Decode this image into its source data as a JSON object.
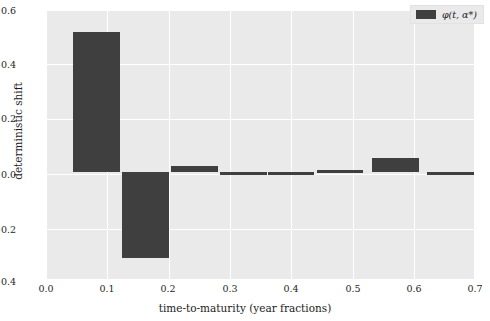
{
  "chart_data": {
    "type": "bar",
    "title": "",
    "xlabel": "time-to-maturity (year fractions)",
    "ylabel": "deterministic shift",
    "xlim": [
      0.0,
      0.7
    ],
    "ylim": [
      -0.4,
      0.6
    ],
    "xticks": [
      "0.0",
      "0.1",
      "0.2",
      "0.3",
      "0.4",
      "0.5",
      "0.6",
      "0.7"
    ],
    "xtick_values": [
      0.0,
      0.1,
      0.2,
      0.3,
      0.4,
      0.5,
      0.6,
      0.7
    ],
    "yticks": [
      "0.6",
      "0.4",
      "0.2",
      "0.0",
      "−0.2",
      "−0.4"
    ],
    "ytick_values": [
      0.6,
      0.4,
      0.2,
      0.0,
      -0.2,
      -0.4
    ],
    "grid": true,
    "legend_position": "upper right",
    "bar_color": "#3f3f3f",
    "plot_background": "#eaeaea",
    "gridline_color": "#ffffff",
    "figure_background": "#ffffff",
    "bar_width": 0.076,
    "series": [
      {
        "name": "φ(t, α*)",
        "x": [
          0.082,
          0.162,
          0.242,
          0.322,
          0.4,
          0.48,
          0.57,
          0.66
        ],
        "values": [
          0.52,
          -0.32,
          0.021,
          -0.006,
          -0.006,
          0.007,
          0.052,
          -0.012
        ]
      }
    ],
    "categories": [
      "0.082",
      "0.162",
      "0.242",
      "0.322",
      "0.400",
      "0.480",
      "0.570",
      "0.660"
    ],
    "annotations": []
  },
  "legend": {
    "label": "φ(t, α*)"
  }
}
